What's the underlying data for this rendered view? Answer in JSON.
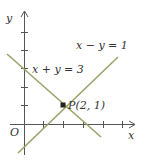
{
  "diagram": {
    "type": "coordinate-plane-graph",
    "axes": {
      "x_label": "x",
      "y_label": "y",
      "origin_label": "O",
      "x_ticks": [
        1,
        2,
        3,
        4,
        5
      ],
      "y_ticks": [
        1,
        2,
        3,
        4,
        5
      ]
    },
    "lines": [
      {
        "equation": "x − y = 1",
        "label": "x − y = 1"
      },
      {
        "equation": "x + y = 3",
        "label": "x + y = 3"
      }
    ],
    "point": {
      "label": "P(2, 1)",
      "x": 2,
      "y": 1
    },
    "colors": {
      "axis": "#555555",
      "line": "#9aa36a",
      "point": "#222222",
      "text": "#333333"
    }
  }
}
